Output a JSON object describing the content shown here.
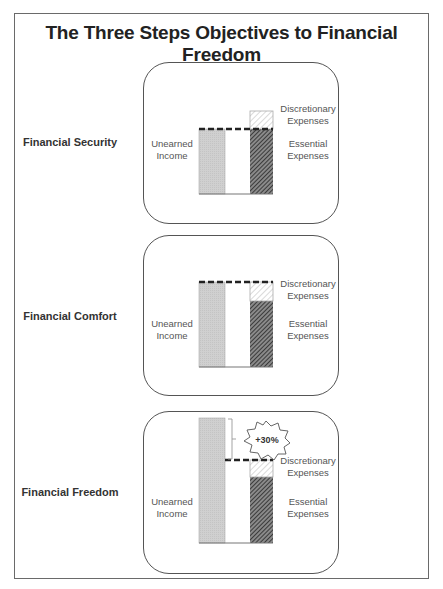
{
  "title": "The Three Steps Objectives to Financial Freedom",
  "colors": {
    "frame": "#6a6a6a",
    "income_bar": "#cfcfcf",
    "essential_hatch": "#3a3a3a",
    "discretionary_hatch": "#bdbdbd",
    "dashed_line": "#222222"
  },
  "labels": {
    "unearned_income": [
      "Unearned",
      "Income"
    ],
    "discretionary_expenses": [
      "Discretionary",
      "Expenses"
    ],
    "essential_expenses": [
      "Essential",
      "Expenses"
    ]
  },
  "steps": [
    {
      "name": "Financial Security",
      "description": "Unearned income covers essential expenses only",
      "income_level": "essential",
      "badge": null
    },
    {
      "name": "Financial Comfort",
      "description": "Unearned income covers essential and discretionary expenses",
      "income_level": "total",
      "badge": null
    },
    {
      "name": "Financial Freedom",
      "description": "Unearned income exceeds total expenses",
      "income_level": "total_plus_margin",
      "badge": "+30%"
    }
  ],
  "step_labels": {
    "s0": "Financial Security",
    "s1": "Financial Comfort",
    "s2": "Financial Freedom"
  },
  "badge_text": "+30%",
  "t": {
    "unearned1": "Unearned",
    "unearned2": "Income",
    "disc1": "Discretionary",
    "disc2": "Expenses",
    "ess1": "Essential",
    "ess2": "Expenses"
  }
}
